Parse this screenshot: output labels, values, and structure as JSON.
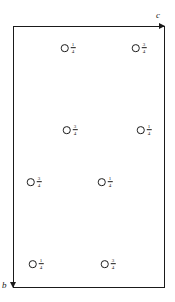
{
  "figure": {
    "type": "crystal-structure-projection",
    "background_color": "#ffffff",
    "line_color": "#1a1a1a"
  },
  "cell": {
    "name": "unit-cell-outline",
    "left": 13,
    "top": 26,
    "width": 152,
    "height": 262
  },
  "axes": [
    {
      "label": "c",
      "name": "axis-label-c",
      "direction": "right",
      "position": "top-right"
    },
    {
      "label": "b",
      "name": "axis-label-b",
      "direction": "down",
      "position": "bottom-left"
    }
  ],
  "atoms": [
    {
      "id": 1,
      "symbol": "O",
      "marker": "open-circle",
      "height_numerator": "1",
      "height_denominator": "4",
      "x": 68,
      "y": 48
    },
    {
      "id": 2,
      "symbol": "O",
      "marker": "open-circle",
      "height_numerator": "3",
      "height_denominator": "4",
      "x": 139,
      "y": 48
    },
    {
      "id": 3,
      "symbol": "O",
      "marker": "open-circle",
      "height_numerator": "3",
      "height_denominator": "4",
      "x": 70,
      "y": 130
    },
    {
      "id": 4,
      "symbol": "O",
      "marker": "open-circle",
      "height_numerator": "1",
      "height_denominator": "4",
      "x": 144,
      "y": 130
    },
    {
      "id": 5,
      "symbol": "O",
      "marker": "open-circle",
      "height_numerator": "3",
      "height_denominator": "4",
      "x": 34,
      "y": 182
    },
    {
      "id": 6,
      "symbol": "O",
      "marker": "open-circle",
      "height_numerator": "1",
      "height_denominator": "4",
      "x": 105,
      "y": 182
    },
    {
      "id": 7,
      "symbol": "O",
      "marker": "open-circle",
      "height_numerator": "1",
      "height_denominator": "4",
      "x": 36,
      "y": 264
    },
    {
      "id": 8,
      "symbol": "O",
      "marker": "open-circle",
      "height_numerator": "3",
      "height_denominator": "4",
      "x": 108,
      "y": 264
    }
  ]
}
